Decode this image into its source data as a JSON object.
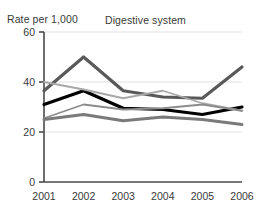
{
  "chart_data": {
    "type": "line",
    "title": "Digestive system",
    "xlabel": "",
    "ylabel": "Rate per 1,000",
    "categories": [
      "2001",
      "2002",
      "2003",
      "2004",
      "2005",
      "2006"
    ],
    "ylim": [
      0,
      60
    ],
    "yticks": [
      0,
      20,
      40,
      60
    ],
    "ytick_labels": [
      "0",
      "20",
      "40",
      "60"
    ],
    "grid": true,
    "gridlines_at": [
      20,
      40,
      60
    ],
    "legend": "none",
    "series": [
      {
        "name": "series-dark-gray",
        "color": "#595959",
        "width": 3.2,
        "values": [
          36.5,
          50.0,
          36.5,
          34.0,
          33.5,
          46.0
        ]
      },
      {
        "name": "series-black",
        "color": "#000000",
        "width": 3.2,
        "values": [
          31.0,
          36.5,
          29.5,
          29.0,
          27.0,
          30.0
        ]
      },
      {
        "name": "series-light-gray",
        "color": "#a8a8a8",
        "width": 1.8,
        "values": [
          40.0,
          37.0,
          33.5,
          36.5,
          31.5,
          28.5
        ]
      },
      {
        "name": "series-medium-gray",
        "color": "#8c8c8c",
        "width": 1.8,
        "values": [
          25.5,
          31.0,
          29.0,
          29.5,
          31.0,
          28.5
        ]
      },
      {
        "name": "series-gray-lower",
        "color": "#7a7a7a",
        "width": 3.0,
        "values": [
          25.0,
          27.0,
          24.5,
          26.0,
          25.0,
          23.0
        ]
      }
    ],
    "colors": {
      "axis": "#4a4a4a",
      "grid": "#e2e2e2",
      "text": "#3a3a3a",
      "background": "#ffffff"
    }
  }
}
